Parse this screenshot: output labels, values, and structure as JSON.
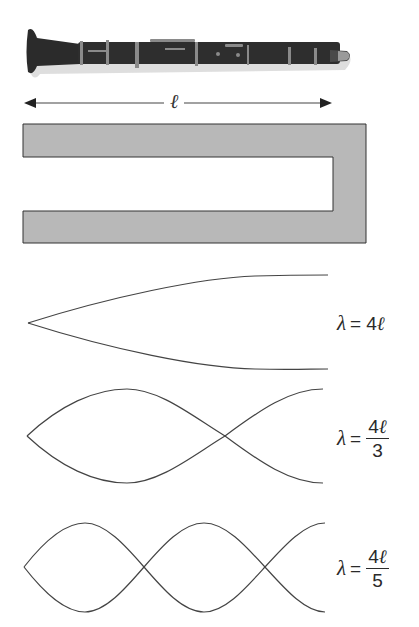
{
  "figure": {
    "instrument": "clarinet",
    "length_symbol": "ℓ",
    "tube": {
      "description": "tube closed at one end (right), open at the other (left)",
      "fill_color": "#b8b8b8",
      "stroke_color": "#333333"
    },
    "modes": [
      {
        "label_lhs": "λ",
        "label_eq": "=",
        "label_num": "4",
        "label_ell": "ℓ",
        "label_den": "",
        "harmonic": 1
      },
      {
        "label_lhs": "λ",
        "label_eq": "=",
        "label_num": "4",
        "label_ell": "ℓ",
        "label_den": "3",
        "harmonic": 3
      },
      {
        "label_lhs": "λ",
        "label_eq": "=",
        "label_num": "4",
        "label_ell": "ℓ",
        "label_den": "5",
        "harmonic": 5
      }
    ],
    "colors": {
      "line": "#444444",
      "clarinet_body": "#2b2b2b",
      "clarinet_metal": "#8a8a8a"
    }
  }
}
